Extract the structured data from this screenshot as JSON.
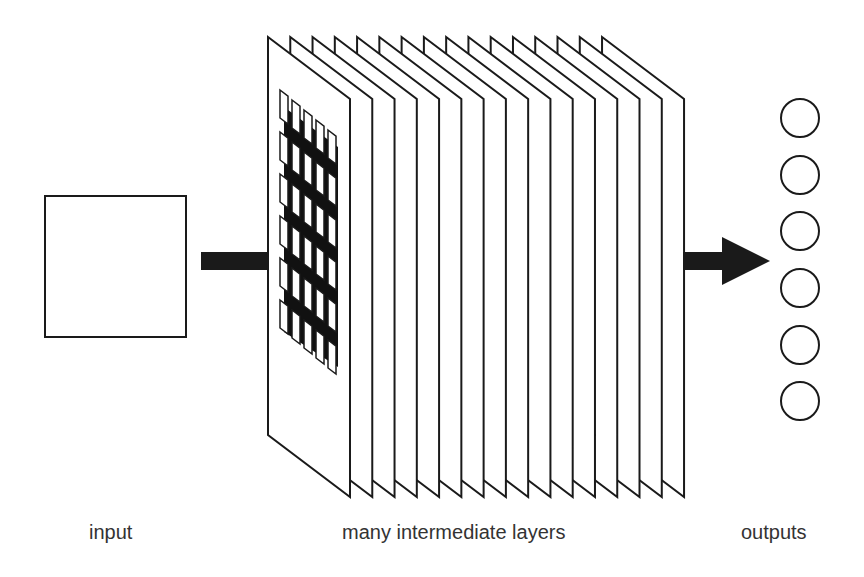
{
  "diagram": {
    "type": "neural-network-architecture",
    "labels": {
      "input": "input",
      "layers": "many intermediate layers",
      "outputs": "outputs"
    },
    "input_box": {
      "x": 45,
      "y": 196,
      "width": 141,
      "height": 141
    },
    "input_arrow": {
      "x1": 201,
      "x2": 269,
      "y": 261,
      "thickness": 18
    },
    "layers": {
      "count": 16,
      "first_left_x": 268,
      "step_x": 22.27,
      "top_left_y": 37,
      "bottom_left_y": 435,
      "depth_dx": 82,
      "depth_dy": 62,
      "front_grid_columns": 5,
      "rows_per_column": 6
    },
    "output_arrow": {
      "x1": 683,
      "x2": 770,
      "y": 261,
      "thickness": 18,
      "head_length": 48,
      "head_half_height": 24
    },
    "outputs": {
      "count": 6,
      "cx": 800,
      "r": 19,
      "cy": [
        118,
        175,
        231,
        288,
        345,
        401
      ]
    },
    "colors": {
      "stroke": "#1a1a1a",
      "fill": "#ffffff",
      "arrow": "#1a1a1a",
      "text": "#333333"
    }
  }
}
